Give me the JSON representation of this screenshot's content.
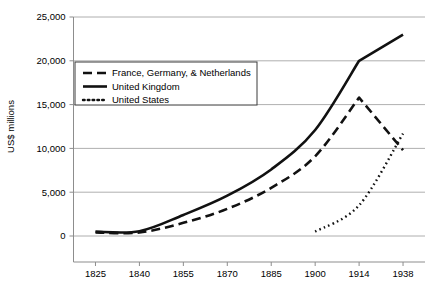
{
  "chart_data": {
    "type": "line",
    "title": "",
    "subtitle": "",
    "xlabel": "",
    "ylabel": "US$ millions",
    "x": [
      1825,
      1840,
      1855,
      1870,
      1885,
      1900,
      1914,
      1938
    ],
    "categories": [
      "1825",
      "1840",
      "1855",
      "1870",
      "1885",
      "1900",
      "1914",
      "1938"
    ],
    "xlim": [
      1825,
      1938
    ],
    "ylim": [
      0,
      25000
    ],
    "ytick_labels": [
      "0",
      "5,000",
      "10,000",
      "15,000",
      "20,000",
      "25,000"
    ],
    "ytick_values": [
      0,
      5000,
      10000,
      15000,
      20000,
      25000
    ],
    "grid": "horizontal",
    "legend_position": "upper-left-inside",
    "series": [
      {
        "name": "France, Germany, & Netherlands",
        "style": "dashed",
        "color": "#111111",
        "x": [
          1825,
          1840,
          1855,
          1870,
          1885,
          1900,
          1914,
          1938
        ],
        "values": [
          400,
          400,
          1500,
          3100,
          5500,
          9100,
          15800,
          9800
        ]
      },
      {
        "name": "United Kingdom",
        "style": "solid",
        "color": "#111111",
        "x": [
          1825,
          1840,
          1855,
          1870,
          1885,
          1900,
          1914,
          1938
        ],
        "values": [
          500,
          550,
          2400,
          4600,
          7600,
          12100,
          20000,
          23000
        ]
      },
      {
        "name": "United States",
        "style": "dotted",
        "color": "#111111",
        "x": [
          1900,
          1914,
          1938
        ],
        "values": [
          500,
          3500,
          11700
        ]
      }
    ]
  },
  "legend": {
    "entries": [
      {
        "label": "France, Germany, & Netherlands",
        "style": "dashed"
      },
      {
        "label": "United Kingdom",
        "style": "solid"
      },
      {
        "label": "United States",
        "style": "dotted"
      }
    ]
  },
  "axes": {
    "y_title": "US$ millions"
  }
}
